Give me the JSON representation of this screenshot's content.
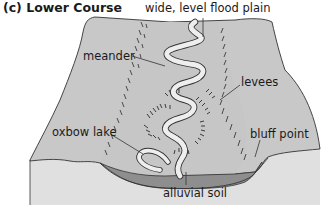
{
  "figure": {
    "title": "(c)  Lower Course",
    "colors": {
      "land_top": "#c8c8c8",
      "land_side": "#e0e0e0",
      "alluvium": "#8e8e8e",
      "river": "#eeeeee",
      "outline": "#333333",
      "hatch": "#2a2a2a"
    },
    "labels": {
      "flood_plain": "wide, level flood plain",
      "meander": "meander",
      "levees": "levees",
      "oxbow_lake": "oxbow lake",
      "bluff_point": "bluff point",
      "alluvial_soil": "alluvial soil"
    }
  }
}
